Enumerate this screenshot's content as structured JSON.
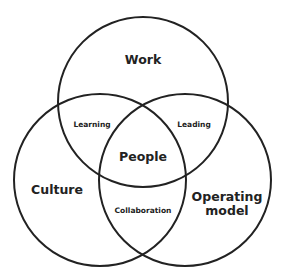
{
  "diagram": {
    "type": "venn",
    "stroke_color": "#222222",
    "circles": [
      {
        "id": "work",
        "label": "Work",
        "cx": 143,
        "cy": 102,
        "r": 85
      },
      {
        "id": "culture",
        "label": "Culture",
        "cx": 100,
        "cy": 180,
        "r": 86
      },
      {
        "id": "operating-model",
        "label": "Operating model",
        "line1": "Operating",
        "line2": "model",
        "cx": 185,
        "cy": 180,
        "r": 86
      }
    ],
    "intersections": {
      "work_culture": "Learning",
      "work_operating": "Leading",
      "culture_operating": "Collaboration",
      "center": "People"
    }
  }
}
